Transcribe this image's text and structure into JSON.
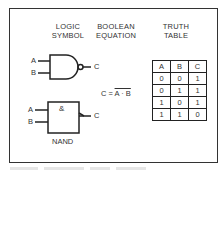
{
  "headers": {
    "logic_symbol": [
      "LOGIC",
      "SYMBOL"
    ],
    "boolean_equation": [
      "BOOLEAN",
      "EQUATION"
    ],
    "truth_table": [
      "TRUTH",
      "TABLE"
    ]
  },
  "ansi_gate": {
    "input_a": "A",
    "input_b": "B",
    "output": "C"
  },
  "iec_gate": {
    "input_a": "A",
    "input_b": "B",
    "output": "C",
    "symbol": "&",
    "name": "NAND"
  },
  "equation": {
    "lhs": "C =",
    "rhs": "A · B"
  },
  "truth_table": {
    "columns": [
      "A",
      "B",
      "C"
    ],
    "rows": [
      [
        "0",
        "0",
        "1"
      ],
      [
        "0",
        "1",
        "1"
      ],
      [
        "1",
        "0",
        "1"
      ],
      [
        "1",
        "1",
        "0"
      ]
    ]
  }
}
